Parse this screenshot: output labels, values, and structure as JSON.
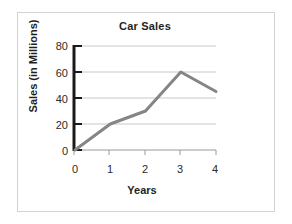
{
  "chart_data": {
    "type": "line",
    "title": "Car Sales",
    "xlabel": "Years",
    "ylabel": "Sales (in Millions)",
    "x": [
      0,
      1,
      2,
      3,
      4
    ],
    "values": [
      0,
      20,
      30,
      60,
      45
    ],
    "categories": [
      "0",
      "1",
      "2",
      "3",
      "4"
    ],
    "xticklabels": [
      "0",
      "1",
      "2",
      "3",
      "4"
    ],
    "yticklabels": [
      "0",
      "20",
      "40",
      "60",
      "80"
    ],
    "yticks": [
      0,
      20,
      40,
      60,
      80
    ],
    "xlim": [
      0,
      4
    ],
    "ylim": [
      0,
      80
    ],
    "grid": "horizontal",
    "legend": "none",
    "series": [
      {
        "name": "Car Sales",
        "values": [
          0,
          20,
          30,
          60,
          45
        ]
      }
    ],
    "colors": {
      "line": "#858585",
      "axis": "#1a1a1a",
      "grid": "#c8c8c8",
      "frame": "#d2d2d2",
      "background": "#ffffff",
      "text": "#1f1f1f"
    }
  }
}
